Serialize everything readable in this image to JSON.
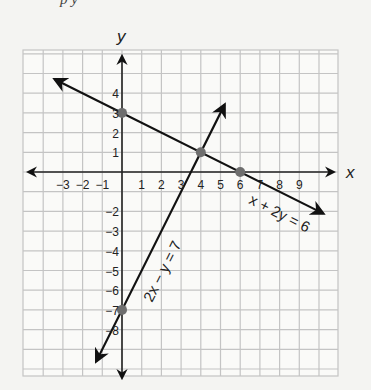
{
  "caption": "p            y",
  "chart_data": {
    "type": "line",
    "title": "",
    "xlabel": "x",
    "ylabel": "y",
    "xlim": [
      -5,
      11
    ],
    "ylim": [
      -10,
      6
    ],
    "grid": true,
    "x_ticks": [
      "−3",
      "−2",
      "−1",
      "1",
      "2",
      "3",
      "4",
      "5",
      "6",
      "7",
      "8",
      "9"
    ],
    "y_ticks": [
      "4",
      "3",
      "2",
      "1",
      "−2",
      "−3",
      "−4",
      "−5",
      "−6",
      "−7",
      "−8"
    ],
    "series": [
      {
        "name": "x + 2y = 6",
        "equation": "x + 2y = 6",
        "slope": -0.5,
        "intercept": 3,
        "x_range": [
          -3.4,
          10.2
        ]
      },
      {
        "name": "2x − y = 7",
        "equation": "2x − y = 7",
        "slope": 2,
        "intercept": -7,
        "x_range": [
          -1.3,
          5.2
        ]
      }
    ],
    "points": [
      {
        "label": "y-intercept of x + 2y = 6",
        "x": 0,
        "y": 3
      },
      {
        "label": "intersection",
        "x": 4,
        "y": 1
      },
      {
        "label": "x-intercept of x + 2y = 6",
        "x": 6,
        "y": 0
      },
      {
        "label": "y-intercept of 2x − y = 7",
        "x": 0,
        "y": -7
      }
    ],
    "colors": {
      "line": "#111111",
      "point": "#6e6e6e",
      "grid": "#c4c4c4",
      "background": "#f4f4f2"
    }
  }
}
